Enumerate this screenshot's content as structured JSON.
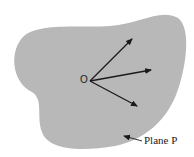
{
  "diagram": {
    "plane": {
      "label": "Plane P",
      "fill": "#b8b8b8"
    },
    "origin": {
      "label": "O",
      "x": 86,
      "y": 81
    },
    "vectors": [
      {
        "to_x": 132,
        "to_y": 39
      },
      {
        "to_x": 151,
        "to_y": 70
      },
      {
        "to_x": 137,
        "to_y": 106
      }
    ],
    "colors": {
      "ink": "#1a1a1a",
      "background": "#ffffff"
    }
  }
}
